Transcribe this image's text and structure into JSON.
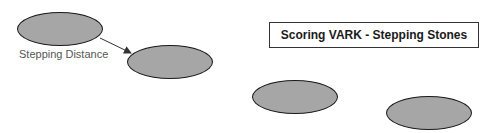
{
  "title": "Scoring VARK - Stepping Stones",
  "label": "Stepping Distance",
  "colors": {
    "stone_fill": "#a6a6a6",
    "stone_border": "#1a1a1a",
    "label_text": "#555555",
    "arrow": "#333333"
  },
  "stones": [
    {
      "id": 1,
      "x": 17,
      "y": 12,
      "w": 86,
      "h": 34
    },
    {
      "id": 2,
      "x": 127,
      "y": 45,
      "w": 86,
      "h": 34
    },
    {
      "id": 3,
      "x": 252,
      "y": 80,
      "w": 86,
      "h": 34
    },
    {
      "id": 4,
      "x": 386,
      "y": 96,
      "w": 86,
      "h": 34
    }
  ],
  "arrow": {
    "from": [
      100,
      38
    ],
    "to": [
      131,
      53
    ]
  }
}
